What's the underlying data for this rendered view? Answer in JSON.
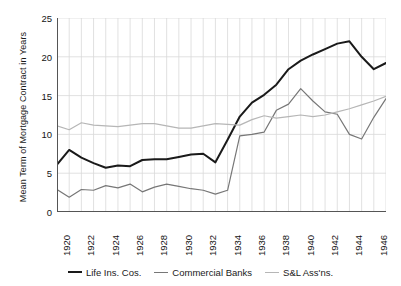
{
  "chart_data": {
    "type": "line",
    "title": "",
    "xlabel": "",
    "ylabel": "Mean Term of Mortgage Contract in Years",
    "xlim": [
      1920,
      1947
    ],
    "ylim": [
      0,
      25
    ],
    "yticks": [
      0,
      5,
      10,
      15,
      20,
      25
    ],
    "xticks": [
      1920,
      1921,
      1922,
      1923,
      1924,
      1925,
      1926,
      1927,
      1928,
      1929,
      1930,
      1931,
      1932,
      1933,
      1934,
      1935,
      1936,
      1937,
      1938,
      1939,
      1940,
      1941,
      1942,
      1943,
      1944,
      1945,
      1946,
      1947
    ],
    "xtick_labels": [
      "1920",
      "",
      "1922",
      "",
      "1924",
      "",
      "1926",
      "",
      "1928",
      "",
      "1930",
      "",
      "1932",
      "",
      "1934",
      "",
      "1936",
      "",
      "1938",
      "",
      "1940",
      "",
      "1942",
      "",
      "1944",
      "",
      "1946",
      ""
    ],
    "grid": true,
    "grid_x": true,
    "grid_y": true,
    "legend_position": "below",
    "x": [
      1920,
      1921,
      1922,
      1923,
      1924,
      1925,
      1926,
      1927,
      1928,
      1929,
      1930,
      1931,
      1932,
      1933,
      1934,
      1935,
      1936,
      1937,
      1938,
      1939,
      1940,
      1941,
      1942,
      1943,
      1944,
      1945,
      1946,
      1947
    ],
    "series": [
      {
        "name": "Life Ins. Cos.",
        "color": "#1a1a1a",
        "width": 2.0,
        "values": [
          6.1,
          8.0,
          7.0,
          6.3,
          5.7,
          6.0,
          5.9,
          6.7,
          6.8,
          6.8,
          7.1,
          7.4,
          7.5,
          6.4,
          9.3,
          12.3,
          14.1,
          15.1,
          16.4,
          18.4,
          19.5,
          20.3,
          21.0,
          21.7,
          22.0,
          20.0,
          18.4,
          19.2
        ]
      },
      {
        "name": "Commercial Banks",
        "color": "#777777",
        "width": 1.2,
        "values": [
          2.9,
          1.9,
          2.9,
          2.8,
          3.4,
          3.1,
          3.6,
          2.6,
          3.2,
          3.6,
          3.3,
          3.0,
          2.8,
          2.3,
          2.8,
          9.8,
          10.0,
          10.3,
          13.1,
          13.9,
          15.9,
          14.3,
          12.9,
          12.6,
          10.0,
          9.4,
          12.2,
          14.6
        ]
      },
      {
        "name": "S&L Ass'ns.",
        "color": "#b6b6b6",
        "width": 1.2,
        "values": [
          11.1,
          10.6,
          11.5,
          11.2,
          11.1,
          11.0,
          11.2,
          11.4,
          11.4,
          11.1,
          10.8,
          10.8,
          11.1,
          11.4,
          11.3,
          11.2,
          11.9,
          12.4,
          12.1,
          12.3,
          12.5,
          12.3,
          12.5,
          12.9,
          13.3,
          13.8,
          14.3,
          14.9
        ]
      }
    ]
  },
  "legend": {
    "items": [
      {
        "label": "Life Ins. Cos.",
        "color": "#1a1a1a",
        "width": 2.0
      },
      {
        "label": "Commercial Banks",
        "color": "#777777",
        "width": 1.5
      },
      {
        "label": "S&L Ass'ns.",
        "color": "#b6b6b6",
        "width": 1.5
      }
    ]
  },
  "axes": {
    "spine_color": "#555555",
    "grid_color": "#d9d9d9"
  }
}
